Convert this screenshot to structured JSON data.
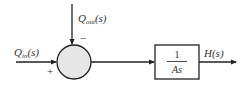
{
  "diagram": {
    "type": "block-diagram",
    "colors": {
      "line": "#222222",
      "junction_fill": "#e6e6e6",
      "text": "#333333"
    },
    "inputs": {
      "q_in": {
        "main": "Q",
        "sub": "in",
        "arg": "(s)",
        "sign": "+"
      },
      "q_out": {
        "main": "Q",
        "sub": "out",
        "arg": "(s)",
        "sign": "−"
      }
    },
    "summing_junction": {
      "icon": "summing-junction-circle"
    },
    "block": {
      "numerator": "1",
      "denominator": "As"
    },
    "output": {
      "label": "H(s)"
    }
  }
}
